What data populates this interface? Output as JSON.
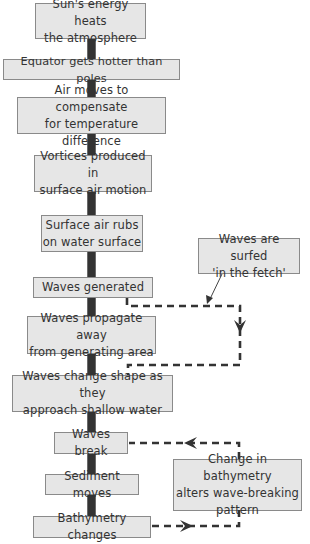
{
  "diagram": {
    "colors": {
      "box_fill": "#e6e6e6",
      "box_border": "#8a8a8a",
      "text": "#333333",
      "spine": "#333333",
      "dashed": "#333333"
    },
    "main_flow": [
      {
        "id": "sun",
        "text": "Sun's energy heats\nthe atmosphere"
      },
      {
        "id": "equator",
        "text": "Equator gets hotter than poles"
      },
      {
        "id": "air-moves",
        "text": "Air moves to compensate\nfor temperature difference"
      },
      {
        "id": "vortices",
        "text": "Vortices produced in\nsurface air motion"
      },
      {
        "id": "air-rubs",
        "text": "Surface air rubs\non water surface"
      },
      {
        "id": "waves-generated",
        "text": "Waves generated"
      },
      {
        "id": "waves-propagate",
        "text": "Waves propagate away\nfrom generating area"
      },
      {
        "id": "waves-change",
        "text": "Waves change shape as they\napproach shallow water"
      },
      {
        "id": "waves-break",
        "text": "Waves break"
      },
      {
        "id": "sediment",
        "text": "Sediment moves"
      },
      {
        "id": "bathymetry",
        "text": "Bathymetry changes"
      }
    ],
    "side_notes": [
      {
        "id": "fetch",
        "text": "Waves are surfed\n'in the fetch'"
      },
      {
        "id": "bathymetry-feedback",
        "text": "Change in bathymetry\nalters wave-breaking\npattern"
      }
    ],
    "connections": [
      {
        "from": "waves-generated",
        "to": "waves-change",
        "style": "dashed",
        "note": "fetch"
      },
      {
        "from": "bathymetry",
        "to": "waves-break",
        "style": "dashed",
        "note": "bathymetry-feedback"
      }
    ]
  }
}
